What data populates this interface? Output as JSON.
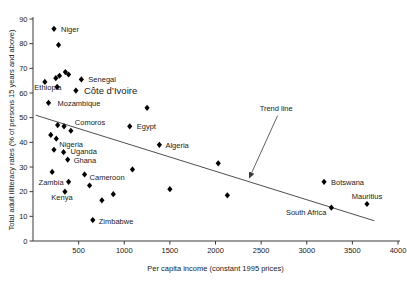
{
  "chart_data": {
    "type": "scatter",
    "title": "",
    "xlabel": "Per capita income (constant 1995 prices)",
    "ylabel": "Total adult illiteracy rates (% of persons 15 years and above)",
    "xlim": [
      0,
      4000
    ],
    "ylim": [
      0,
      90
    ],
    "x_ticks": [
      500,
      1000,
      1500,
      2000,
      2500,
      3000,
      3500,
      4000
    ],
    "y_ticks": [
      0,
      10,
      20,
      30,
      40,
      50,
      60,
      70,
      80,
      90
    ],
    "grid": false,
    "legend": "none",
    "background_color": "#ffffff",
    "marker_color": "#000000",
    "line_color": "#3a3a3a",
    "marker_shape": "diamond",
    "points": [
      {
        "x": 230,
        "y": 86,
        "label": "Niger",
        "dx": 7,
        "dy": 3,
        "anchor": "start"
      },
      {
        "x": 280,
        "y": 79.5
      },
      {
        "x": 130,
        "y": 64.5,
        "label": "Ethiopia",
        "dx": 3,
        "dy": 8,
        "anchor": "middle"
      },
      {
        "x": 250,
        "y": 66
      },
      {
        "x": 290,
        "y": 67
      },
      {
        "x": 355,
        "y": 68.5
      },
      {
        "x": 390,
        "y": 67.5
      },
      {
        "x": 530,
        "y": 65.5,
        "label": "Senegal",
        "dx": 7,
        "dy": 3,
        "anchor": "start"
      },
      {
        "x": 265,
        "y": 62.5
      },
      {
        "x": 470,
        "y": 61,
        "label": "Côte d’Ivoire",
        "dx": 8,
        "dy": 3.5,
        "anchor": "start",
        "size": 9.5
      },
      {
        "x": 170,
        "y": 56,
        "label": "Mozambique",
        "dx": 9,
        "dy": 3.5,
        "anchor": "start"
      },
      {
        "x": 415,
        "y": 44.7,
        "label": "Comoros",
        "dx": 4,
        "dy": -6,
        "anchor": "start"
      },
      {
        "x": 1250,
        "y": 54
      },
      {
        "x": 1060,
        "y": 46.5,
        "label": "Egypt",
        "dx": 7,
        "dy": 3,
        "anchor": "start"
      },
      {
        "x": 270,
        "y": 47
      },
      {
        "x": 340,
        "y": 46.5
      },
      {
        "x": 195,
        "y": 43
      },
      {
        "x": 255,
        "y": 41.5,
        "label": "Nigeria",
        "dx": 3,
        "dy": 8,
        "anchor": "start"
      },
      {
        "x": 230,
        "y": 37
      },
      {
        "x": 335,
        "y": 36,
        "label": "Uganda",
        "dx": 7,
        "dy": 2,
        "anchor": "start"
      },
      {
        "x": 380,
        "y": 33,
        "label": "Ghana",
        "dx": 6,
        "dy": 3,
        "anchor": "start"
      },
      {
        "x": 1385,
        "y": 39,
        "label": "Algeria",
        "dx": 6,
        "dy": 3,
        "anchor": "start"
      },
      {
        "x": 1090,
        "y": 29
      },
      {
        "x": 2030,
        "y": 31.5
      },
      {
        "x": 210,
        "y": 28
      },
      {
        "x": 565,
        "y": 27,
        "label": "Cameroon",
        "dx": 5,
        "dy": 6,
        "anchor": "start"
      },
      {
        "x": 390,
        "y": 24,
        "label": "Zambia",
        "dx": -5,
        "dy": 3.5,
        "anchor": "end"
      },
      {
        "x": 620,
        "y": 22.5
      },
      {
        "x": 350,
        "y": 20,
        "label": "Kenya",
        "dx": -3,
        "dy": 8,
        "anchor": "middle"
      },
      {
        "x": 880,
        "y": 19
      },
      {
        "x": 755,
        "y": 16.5
      },
      {
        "x": 1500,
        "y": 21
      },
      {
        "x": 2130,
        "y": 18.5
      },
      {
        "x": 655,
        "y": 8.5,
        "label": "Zimbabwe",
        "dx": 6,
        "dy": 3.5,
        "anchor": "start"
      },
      {
        "x": 3190,
        "y": 24,
        "label": "Botswana",
        "dx": 7,
        "dy": 3,
        "anchor": "start"
      },
      {
        "x": 3660,
        "y": 15,
        "label": "Mauritius",
        "dx": 0,
        "dy": -5.5,
        "anchor": "middle"
      },
      {
        "x": 3270,
        "y": 13.5,
        "label": "South Africa",
        "dx": -5,
        "dy": 7,
        "anchor": "end"
      }
    ],
    "trend_line": {
      "x1": 30,
      "y1": 51,
      "x2": 3740,
      "y2": 8.2
    },
    "annotation": {
      "text": "Trend line",
      "text_x": 2665,
      "text_y": 52.7,
      "arrow_from_x": 2680,
      "arrow_from_y": 50.8,
      "arrow_to_x": 2370,
      "arrow_to_y": 25.5
    }
  }
}
